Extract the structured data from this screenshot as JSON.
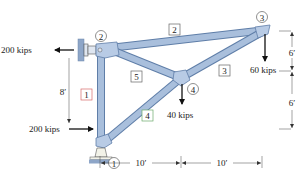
{
  "diagram": {
    "type": "truss",
    "nodes": [
      {
        "id": "1",
        "label": "1"
      },
      {
        "id": "2",
        "label": "2"
      },
      {
        "id": "3",
        "label": "3"
      },
      {
        "id": "4",
        "label": "4"
      }
    ],
    "members": [
      {
        "id": "1",
        "label": "1",
        "from": "1",
        "to": "2"
      },
      {
        "id": "2",
        "label": "2",
        "from": "2",
        "to": "3"
      },
      {
        "id": "3",
        "label": "3",
        "from": "3",
        "to": "4"
      },
      {
        "id": "4",
        "label": "4",
        "from": "1",
        "to": "4"
      },
      {
        "id": "5",
        "label": "5",
        "from": "2",
        "to": "4"
      }
    ],
    "loads": {
      "node2_horizontal": "200 kips",
      "node1_horizontal": "200 kips",
      "node3_vertical": "60 kips",
      "node4_vertical": "40 kips"
    },
    "dimensions": {
      "vertical_left": "8′",
      "vertical_right_top": "6′",
      "vertical_right_bottom": "6′",
      "horizontal_left": "10′",
      "horizontal_right": "10′"
    },
    "colors": {
      "member_fill": "#a9bfdc",
      "member_stroke": "#5f7ea8",
      "support": "#8ea6c8",
      "member_label_1_border": "#d66a6a",
      "member_label_4_border": "#6aaa6a"
    }
  }
}
